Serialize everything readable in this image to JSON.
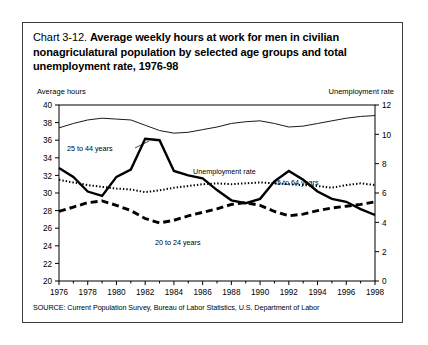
{
  "figure": {
    "title_lead": "Chart 3-12.",
    "title_bold_line1": "Average weekly hours at work for men in civilian",
    "title_bold_line2": "nonagriculatural population by selected age groups and",
    "title_bold_line3": "total unemployment rate, 1976-98",
    "left_axis_caption": "Average hours",
    "right_axis_caption": "Unemployment rate",
    "source": "SOURCE: Current Population Survey, Bureau of Labor Statistics, U.S. Department of Labor"
  },
  "annotations": {
    "a_25_44": "25 to 44 years",
    "a_unemp": "Unemployment rate",
    "a_45_64": "45 to 64 years",
    "a_20_24": "20 to 24 years"
  },
  "chart_data": {
    "type": "line",
    "title": "Chart 3-12. Average weekly hours at work for men in civilian nonagriculatural population by selected age groups and total unemployment rate, 1976-98",
    "xlabel": "",
    "ylabel": "Average hours",
    "y2label": "Unemployment rate",
    "xlim": [
      1976,
      1998
    ],
    "ylim": [
      20,
      40
    ],
    "y2lim": [
      0,
      12
    ],
    "grid": false,
    "legend": "inline-annotations",
    "xticks": [
      1976,
      1978,
      1980,
      1982,
      1984,
      1986,
      1988,
      1990,
      1992,
      1994,
      1996,
      1998
    ],
    "xtick_labels": [
      "1976",
      "1978",
      "1980",
      "1982",
      "1984",
      "1986",
      "1988",
      "1990",
      "1992",
      "1994",
      "1996",
      "1998"
    ],
    "xminor_ticks": [
      1977,
      1979,
      1981,
      1983,
      1985,
      1987,
      1989,
      1991,
      1993,
      1995,
      1997
    ],
    "yticks": [
      20,
      22,
      24,
      26,
      28,
      30,
      32,
      34,
      36,
      38,
      40
    ],
    "ytick_labels": [
      "20",
      "22",
      "24",
      "26",
      "28",
      "30",
      "32",
      "34",
      "36",
      "38",
      "40"
    ],
    "y2ticks": [
      0,
      2,
      4,
      6,
      8,
      10,
      12
    ],
    "y2tick_labels": [
      "0",
      "2",
      "4",
      "6",
      "8",
      "10",
      "12"
    ],
    "x": [
      1976,
      1977,
      1978,
      1979,
      1980,
      1981,
      1982,
      1983,
      1984,
      1985,
      1986,
      1987,
      1988,
      1989,
      1990,
      1991,
      1992,
      1993,
      1994,
      1995,
      1996,
      1997,
      1998
    ],
    "series": [
      {
        "name": "25 to 44 years",
        "axis": "left",
        "style": "thin-solid",
        "values": [
          37.4,
          37.9,
          38.3,
          38.5,
          38.4,
          38.3,
          37.7,
          37.1,
          36.8,
          36.9,
          37.2,
          37.5,
          37.9,
          38.1,
          38.2,
          37.9,
          37.5,
          37.6,
          37.9,
          38.2,
          38.5,
          38.7,
          38.8
        ]
      },
      {
        "name": "45 to 64 years",
        "axis": "left",
        "style": "dotted",
        "values": [
          31.5,
          31.2,
          30.9,
          30.7,
          30.5,
          30.4,
          30.1,
          30.3,
          30.6,
          30.8,
          31.0,
          31.1,
          31.0,
          31.1,
          31.2,
          31.1,
          31.0,
          30.9,
          30.8,
          30.6,
          30.9,
          31.1,
          30.9
        ]
      },
      {
        "name": "20 to 24 years",
        "axis": "left",
        "style": "thick-dashed",
        "values": [
          27.9,
          28.4,
          28.9,
          29.1,
          28.6,
          28.0,
          27.1,
          26.6,
          26.9,
          27.4,
          27.8,
          28.2,
          28.7,
          28.9,
          28.6,
          27.9,
          27.4,
          27.6,
          28.0,
          28.3,
          28.5,
          28.7,
          29.0
        ]
      },
      {
        "name": "Unemployment rate",
        "axis": "right",
        "style": "thick-solid",
        "values": [
          7.7,
          7.1,
          6.1,
          5.8,
          7.1,
          7.6,
          9.7,
          9.6,
          7.5,
          7.2,
          7.0,
          6.2,
          5.5,
          5.3,
          5.6,
          6.8,
          7.5,
          6.9,
          6.1,
          5.6,
          5.4,
          4.9,
          4.5
        ]
      }
    ]
  }
}
